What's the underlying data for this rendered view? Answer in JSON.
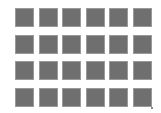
{
  "grid": {
    "rows": 4,
    "columns": 6,
    "tile_color": "#6f6f6f",
    "tile_border_color": "#9a9a9a",
    "tiles": [
      {
        "row": 1,
        "col": 1
      },
      {
        "row": 1,
        "col": 2
      },
      {
        "row": 1,
        "col": 3
      },
      {
        "row": 1,
        "col": 4
      },
      {
        "row": 1,
        "col": 5
      },
      {
        "row": 1,
        "col": 6
      },
      {
        "row": 2,
        "col": 1
      },
      {
        "row": 2,
        "col": 2
      },
      {
        "row": 2,
        "col": 3
      },
      {
        "row": 2,
        "col": 4
      },
      {
        "row": 2,
        "col": 5
      },
      {
        "row": 2,
        "col": 6
      },
      {
        "row": 3,
        "col": 1
      },
      {
        "row": 3,
        "col": 2
      },
      {
        "row": 3,
        "col": 3
      },
      {
        "row": 3,
        "col": 4
      },
      {
        "row": 3,
        "col": 5
      },
      {
        "row": 3,
        "col": 6
      },
      {
        "row": 4,
        "col": 1
      },
      {
        "row": 4,
        "col": 2
      },
      {
        "row": 4,
        "col": 3
      },
      {
        "row": 4,
        "col": 4
      },
      {
        "row": 4,
        "col": 5
      },
      {
        "row": 4,
        "col": 6
      }
    ]
  },
  "background_color": "#ffffff",
  "corner_grip": {
    "icon": "resize-grip-icon"
  }
}
